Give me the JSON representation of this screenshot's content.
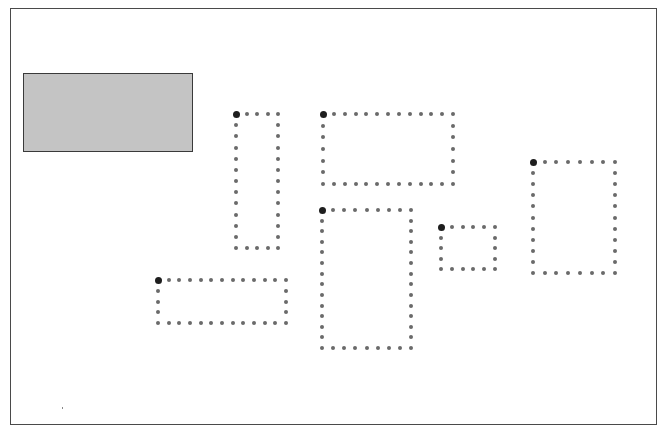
{
  "canvas": {
    "frame": {
      "x": 10,
      "y": 8,
      "w": 647,
      "h": 417
    },
    "border_color": "#4a4a4a",
    "background": "#ffffff"
  },
  "colors": {
    "filled_rect_fill": "#c4c4c4",
    "filled_rect_border": "#3a3a3a",
    "dot_color": "#6a6a6a",
    "anchor_color": "#1e1e1e"
  },
  "filled_rect": {
    "x": 23,
    "y": 73,
    "w": 170,
    "h": 79
  },
  "dot_spacing": 11,
  "dotted_boxes": [
    {
      "id": "box-a",
      "x1": 236,
      "y1": 114,
      "x2": 278,
      "y2": 248
    },
    {
      "id": "box-b",
      "x1": 323,
      "y1": 114,
      "x2": 453,
      "y2": 184
    },
    {
      "id": "box-c",
      "x1": 322,
      "y1": 210,
      "x2": 411,
      "y2": 348
    },
    {
      "id": "box-d",
      "x1": 441,
      "y1": 227,
      "x2": 495,
      "y2": 269
    },
    {
      "id": "box-e",
      "x1": 533,
      "y1": 162,
      "x2": 615,
      "y2": 273
    },
    {
      "id": "box-f",
      "x1": 158,
      "y1": 280,
      "x2": 286,
      "y2": 323
    }
  ]
}
